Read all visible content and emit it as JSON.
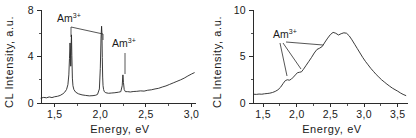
{
  "figure": {
    "panels": [
      {
        "id": "panel-left",
        "xlabel": "Energy, eV",
        "ylabel": "CL Intensity, a.u.",
        "xticks": [
          "1,5",
          "2,0",
          "2,5",
          "3,0"
        ],
        "xtick_values": [
          1.5,
          2.0,
          2.5,
          3.0
        ],
        "yticks": [
          "0",
          "4",
          "8"
        ],
        "ytick_values": [
          0,
          4,
          8
        ],
        "annotations": [
          {
            "label": "Am",
            "sup": "3+",
            "name": "am-label-upper"
          },
          {
            "label": "Am",
            "sup": "3+",
            "name": "am-label-lower"
          }
        ]
      },
      {
        "id": "panel-right",
        "xlabel": "Energy, eV",
        "ylabel": "CL Intensity, a.u.",
        "xticks": [
          "1,5",
          "2,0",
          "2,5",
          "3,0",
          "3,5"
        ],
        "xtick_values": [
          1.5,
          2.0,
          2.5,
          3.0,
          3.5
        ],
        "yticks": [
          "0",
          "5",
          "10"
        ],
        "ytick_values": [
          0,
          5,
          10
        ],
        "annotations": [
          {
            "label": "Am",
            "sup": "3+",
            "name": "am-label"
          }
        ]
      }
    ]
  },
  "chart_data": [
    {
      "type": "line",
      "title": "",
      "xlabel": "Energy, eV",
      "ylabel": "CL Intensity, a.u.",
      "xlim": [
        1.35,
        3.05
      ],
      "ylim": [
        0,
        8.6
      ],
      "grid": false,
      "legend": "none",
      "annotations": [
        {
          "text": "Am3+",
          "points_to": [
            1.68,
            2.02
          ],
          "note": "two sharp narrow emission lines"
        },
        {
          "text": "Am3+",
          "points_to": [
            2.25
          ],
          "note": "weak sharp emission line"
        }
      ],
      "series": [
        {
          "name": "CL spectrum (sharp-line)",
          "x": [
            1.35,
            1.38,
            1.41,
            1.44,
            1.47,
            1.5,
            1.53,
            1.56,
            1.59,
            1.61,
            1.63,
            1.645,
            1.655,
            1.662,
            1.668,
            1.672,
            1.676,
            1.68,
            1.684,
            1.688,
            1.694,
            1.7,
            1.71,
            1.73,
            1.76,
            1.8,
            1.84,
            1.88,
            1.92,
            1.95,
            1.97,
            1.99,
            2.0,
            2.008,
            2.014,
            2.018,
            2.022,
            2.026,
            2.03,
            2.036,
            2.044,
            2.06,
            2.09,
            2.12,
            2.16,
            2.2,
            2.225,
            2.24,
            2.248,
            2.254,
            2.262,
            2.275,
            2.3,
            2.33,
            2.36,
            2.4,
            2.44,
            2.48,
            2.52,
            2.56,
            2.6,
            2.64,
            2.68,
            2.72,
            2.76,
            2.8,
            2.84,
            2.88,
            2.92,
            2.96,
            3.0,
            3.03
          ],
          "y": [
            0.45,
            0.52,
            0.48,
            0.56,
            0.5,
            0.58,
            0.62,
            0.7,
            0.85,
            1.0,
            1.25,
            1.7,
            2.6,
            4.1,
            5.55,
            5.0,
            3.4,
            5.3,
            6.3,
            4.4,
            2.3,
            1.6,
            1.25,
            1.0,
            0.85,
            0.75,
            0.7,
            0.66,
            0.68,
            0.72,
            0.8,
            1.3,
            3.2,
            6.0,
            7.1,
            6.4,
            4.2,
            2.4,
            1.6,
            1.25,
            1.05,
            0.95,
            0.9,
            0.92,
            0.95,
            1.0,
            1.05,
            1.6,
            2.6,
            1.9,
            1.25,
            1.05,
            1.05,
            1.02,
            1.06,
            1.08,
            1.12,
            1.1,
            1.18,
            1.22,
            1.3,
            1.36,
            1.48,
            1.58,
            1.72,
            1.86,
            2.0,
            2.14,
            2.3,
            2.5,
            2.68,
            2.8
          ]
        }
      ]
    },
    {
      "type": "line",
      "title": "",
      "xlabel": "Energy, eV",
      "ylabel": "CL Intensity, a.u.",
      "xlim": [
        1.35,
        3.65
      ],
      "ylim": [
        0,
        10.6
      ],
      "grid": false,
      "legend": "none",
      "annotations": [
        {
          "text": "Am3+",
          "points_to": [
            1.86,
            2.05,
            2.35
          ],
          "note": "three shoulders on the rising edge of a broad band"
        }
      ],
      "series": [
        {
          "name": "CL spectrum (broad band)",
          "x": [
            1.36,
            1.4,
            1.44,
            1.48,
            1.52,
            1.56,
            1.6,
            1.64,
            1.68,
            1.72,
            1.76,
            1.8,
            1.83,
            1.86,
            1.89,
            1.92,
            1.95,
            1.98,
            2.01,
            2.04,
            2.07,
            2.1,
            2.14,
            2.18,
            2.22,
            2.26,
            2.3,
            2.34,
            2.38,
            2.42,
            2.46,
            2.5,
            2.54,
            2.58,
            2.62,
            2.66,
            2.7,
            2.74,
            2.78,
            2.82,
            2.86,
            2.9,
            2.94,
            2.98,
            3.02,
            3.06,
            3.1,
            3.14,
            3.18,
            3.22,
            3.26,
            3.3,
            3.34,
            3.38,
            3.42,
            3.46,
            3.5,
            3.54,
            3.58,
            3.62
          ],
          "y": [
            1.0,
            0.98,
            1.02,
            1.0,
            1.05,
            1.08,
            1.12,
            1.2,
            1.32,
            1.5,
            1.8,
            2.25,
            2.55,
            2.65,
            2.6,
            2.72,
            2.95,
            3.2,
            3.45,
            3.5,
            3.55,
            3.85,
            4.3,
            4.75,
            5.2,
            5.7,
            6.1,
            6.25,
            6.45,
            6.95,
            7.4,
            7.8,
            8.05,
            7.95,
            7.75,
            7.9,
            8.0,
            7.95,
            7.65,
            7.2,
            6.7,
            6.2,
            5.7,
            5.2,
            4.75,
            4.35,
            3.95,
            3.6,
            3.25,
            2.95,
            2.65,
            2.4,
            2.15,
            1.92,
            1.7,
            1.52,
            1.35,
            1.15,
            0.98,
            0.85
          ]
        }
      ]
    }
  ]
}
